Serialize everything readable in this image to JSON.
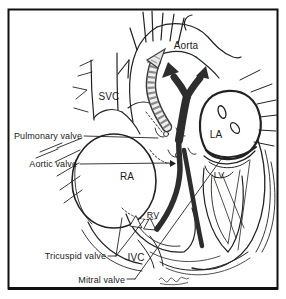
{
  "figure": {
    "labels": {
      "aorta": "Aorta",
      "svc": "SVC",
      "pulmonary_valve": "Pulmonary valve",
      "aortic_valve": "Aortic valve",
      "right_atrium": "RA",
      "left_atrium": "LA",
      "left_ventricle": "LV",
      "right_ventricle": "RV",
      "tricuspid_valve": "Tricuspid valve",
      "ivc": "IVC",
      "mitral_valve": "Mitral valve"
    },
    "colors": {
      "ink": "#222222",
      "background": "#ffffff",
      "dark_flow_arrow": "#2d2d2d",
      "hatched_arrow_fill": "#f0f0f0",
      "hatched_arrow_bands": "#8a8a8a",
      "frame": "#111111"
    }
  }
}
